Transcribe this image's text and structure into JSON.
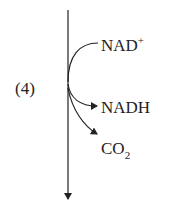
{
  "diagram": {
    "step_label": "(4)",
    "input": {
      "base": "NAD",
      "sup": "+"
    },
    "outputs": [
      {
        "base": "NADH"
      },
      {
        "base": "CO",
        "sub": "2"
      }
    ],
    "colors": {
      "stroke": "#222222",
      "background": "#ffffff"
    }
  }
}
